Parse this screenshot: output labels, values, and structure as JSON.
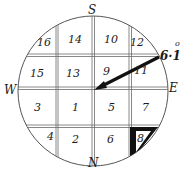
{
  "diagram": {
    "type": "compass-grid",
    "directions": {
      "top": "S",
      "bottom": "N",
      "left": "W",
      "right": "E"
    },
    "cells": [
      {
        "label": "16",
        "x": 37,
        "y": 42
      },
      {
        "label": "14",
        "x": 73,
        "y": 40
      },
      {
        "label": "10",
        "x": 110,
        "y": 40
      },
      {
        "label": "12",
        "x": 136,
        "y": 42
      },
      {
        "label": "15",
        "x": 36,
        "y": 73
      },
      {
        "label": "13",
        "x": 72,
        "y": 73
      },
      {
        "label": "9",
        "x": 106,
        "y": 72
      },
      {
        "label": "11",
        "x": 138,
        "y": 70
      },
      {
        "label": "3",
        "x": 36,
        "y": 107
      },
      {
        "label": "1",
        "x": 74,
        "y": 107
      },
      {
        "label": "5",
        "x": 110,
        "y": 107
      },
      {
        "label": "7",
        "x": 144,
        "y": 107
      },
      {
        "label": "4",
        "x": 49,
        "y": 136
      },
      {
        "label": "2",
        "x": 74,
        "y": 139
      },
      {
        "label": "6",
        "x": 109,
        "y": 139
      },
      {
        "label": "8",
        "x": 136,
        "y": 136
      }
    ],
    "highlighted_cell": "8",
    "arrow": {
      "label": "6·1",
      "superscript": "o",
      "from": [
        159,
        57
      ],
      "to": [
        96,
        89
      ],
      "color": "#111111"
    },
    "colors": {
      "line": "#555555",
      "ink": "#111111",
      "background": "#ffffff"
    }
  }
}
